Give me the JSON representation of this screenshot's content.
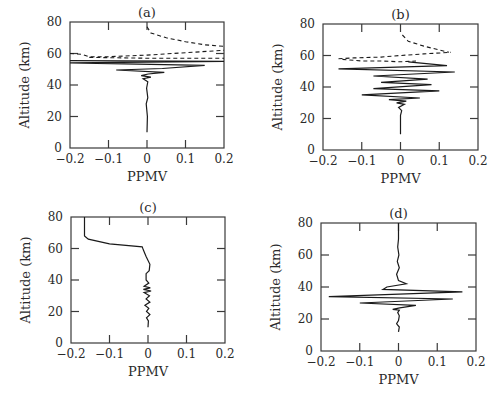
{
  "chart_data": [
    {
      "id": "a",
      "type": "line",
      "panel_label": "(a)",
      "xlabel": "PPMV",
      "ylabel": "Altitude (km)",
      "xlim": [
        -0.2,
        0.2
      ],
      "ylim": [
        0,
        80
      ],
      "xticks": [
        -0.2,
        -0.1,
        0,
        0.1,
        0.2
      ],
      "xtick_labels": [
        "−0.2",
        "−0.1",
        "0",
        "0.1",
        "0.2"
      ],
      "yticks": [
        0,
        20,
        40,
        60,
        80
      ],
      "ytick_labels": [
        "0",
        "20",
        "40",
        "60",
        "80"
      ],
      "frame": {
        "left": 70,
        "top": 22,
        "right": 224,
        "bottom": 148
      },
      "series": [
        {
          "name": "solid",
          "style": "solid",
          "points": [
            [
              0,
              10
            ],
            [
              0.001,
              20
            ],
            [
              -0.002,
              28
            ],
            [
              0.002,
              32
            ],
            [
              -0.001,
              38
            ],
            [
              0.002,
              42
            ],
            [
              -0.01,
              44
            ],
            [
              0.01,
              45
            ],
            [
              -0.015,
              46
            ],
            [
              0.003,
              47
            ],
            [
              0.045,
              48
            ],
            [
              -0.08,
              49.5
            ],
            [
              0.04,
              50.5
            ],
            [
              0.15,
              52.5
            ],
            [
              -0.2,
              54
            ],
            [
              0.2,
              55
            ],
            [
              -0.2,
              55.5
            ]
          ]
        },
        {
          "name": "dashed-upper",
          "style": "dashed",
          "points": [
            [
              0,
              77
            ],
            [
              0.01,
              73
            ],
            [
              0.05,
              70
            ],
            [
              0.1,
              67.5
            ],
            [
              0.15,
              65.5
            ],
            [
              0.2,
              64.5
            ]
          ]
        },
        {
          "name": "dashed-lower",
          "style": "dashed",
          "points": [
            [
              -0.2,
              60
            ],
            [
              -0.17,
              59.5
            ],
            [
              -0.15,
              58
            ],
            [
              -0.1,
              58
            ],
            [
              0,
              59
            ],
            [
              0.1,
              60.5
            ],
            [
              0.2,
              62
            ]
          ]
        },
        {
          "name": "dashed-inner",
          "style": "dashed",
          "points": [
            [
              -0.15,
              57.5
            ],
            [
              0,
              57
            ],
            [
              0.1,
              57
            ],
            [
              0.2,
              57
            ]
          ]
        }
      ]
    },
    {
      "id": "b",
      "type": "line",
      "panel_label": "(b)",
      "xlabel": "PPMV",
      "ylabel": "Altitude (km)",
      "xlim": [
        -0.2,
        0.2
      ],
      "ylim": [
        0,
        80
      ],
      "xticks": [
        -0.2,
        -0.1,
        0,
        0.1,
        0.2
      ],
      "xtick_labels": [
        "−0.2",
        "−0.1",
        "0",
        "0.1",
        "0.2"
      ],
      "yticks": [
        0,
        20,
        40,
        60,
        80
      ],
      "ytick_labels": [
        "0",
        "20",
        "40",
        "60",
        "80"
      ],
      "frame": {
        "left": 323,
        "top": 24,
        "right": 478,
        "bottom": 150
      },
      "series": [
        {
          "name": "solid",
          "style": "solid",
          "points": [
            [
              0,
              10
            ],
            [
              0,
              22
            ],
            [
              0.003,
              25
            ],
            [
              -0.005,
              27
            ],
            [
              0.01,
              29
            ],
            [
              -0.01,
              30
            ],
            [
              0.015,
              31
            ],
            [
              -0.03,
              32
            ],
            [
              0.05,
              33
            ],
            [
              -0.1,
              35
            ],
            [
              0.1,
              37.5
            ],
            [
              -0.07,
              39
            ],
            [
              0.08,
              41.5
            ],
            [
              -0.05,
              43
            ],
            [
              0.07,
              45
            ],
            [
              -0.07,
              47
            ],
            [
              0.14,
              49.5
            ],
            [
              -0.16,
              51.5
            ],
            [
              0.12,
              53.5
            ],
            [
              0.02,
              56
            ]
          ]
        },
        {
          "name": "dashed-upper",
          "style": "dashed",
          "points": [
            [
              0.005,
              73
            ],
            [
              0.02,
              69
            ],
            [
              0.06,
              66
            ],
            [
              0.1,
              63.5
            ],
            [
              0.125,
              62
            ]
          ]
        },
        {
          "name": "dashed-lower",
          "style": "dashed",
          "points": [
            [
              -0.16,
              58
            ],
            [
              -0.12,
              58.5
            ],
            [
              -0.05,
              59
            ],
            [
              0,
              60
            ],
            [
              0.06,
              61
            ],
            [
              0.13,
              62
            ]
          ]
        },
        {
          "name": "dashed-inner",
          "style": "dashed",
          "points": [
            [
              -0.15,
              57.5
            ],
            [
              -0.1,
              56.5
            ],
            [
              -0.05,
              56.5
            ],
            [
              0,
              56
            ],
            [
              0.04,
              56.5
            ]
          ]
        }
      ]
    },
    {
      "id": "c",
      "type": "line",
      "panel_label": "(c)",
      "xlabel": "PPMV",
      "ylabel": "Altitude (km)",
      "xlim": [
        -0.2,
        0.2
      ],
      "ylim": [
        0,
        80
      ],
      "xticks": [
        -0.2,
        -0.1,
        0,
        0.1,
        0.2
      ],
      "xtick_labels": [
        "−0.2",
        "−0.1",
        "0",
        "0.1",
        "0.2"
      ],
      "yticks": [
        0,
        20,
        40,
        60,
        80
      ],
      "ytick_labels": [
        "0",
        "20",
        "40",
        "60",
        "80"
      ],
      "frame": {
        "left": 71,
        "top": 217,
        "right": 225,
        "bottom": 343
      },
      "series": [
        {
          "name": "solid",
          "style": "solid",
          "points": [
            [
              0,
              10
            ],
            [
              0.001,
              14
            ],
            [
              -0.004,
              16
            ],
            [
              0.005,
              18
            ],
            [
              -0.004,
              20
            ],
            [
              0.002,
              22
            ],
            [
              -0.008,
              24
            ],
            [
              0.005,
              26
            ],
            [
              -0.005,
              28
            ],
            [
              0.004,
              30
            ],
            [
              -0.01,
              32
            ],
            [
              0.008,
              33
            ],
            [
              -0.012,
              34
            ],
            [
              0.006,
              35
            ],
            [
              -0.01,
              36
            ],
            [
              0.002,
              38
            ],
            [
              -0.005,
              40
            ],
            [
              -0.005,
              44
            ],
            [
              0.003,
              46
            ],
            [
              0.005,
              50
            ],
            [
              -0.005,
              55
            ],
            [
              -0.012,
              59
            ],
            [
              -0.015,
              61
            ],
            [
              -0.1,
              63
            ],
            [
              -0.155,
              66
            ],
            [
              -0.165,
              68
            ],
            [
              -0.165,
              73
            ],
            [
              -0.165,
              80
            ]
          ]
        }
      ]
    },
    {
      "id": "d",
      "type": "line",
      "panel_label": "(d)",
      "xlabel": "PPMV",
      "ylabel": "Altitude (km)",
      "xlim": [
        -0.2,
        0.2
      ],
      "ylim": [
        0,
        80
      ],
      "xticks": [
        -0.2,
        -0.1,
        0,
        0.1,
        0.2
      ],
      "xtick_labels": [
        "−0.2",
        "−0.1",
        "0",
        "0.1",
        "0.2"
      ],
      "yticks": [
        0,
        20,
        40,
        60,
        80
      ],
      "ytick_labels": [
        "0",
        "20",
        "40",
        "60",
        "80"
      ],
      "frame": {
        "left": 321,
        "top": 223,
        "right": 476,
        "bottom": 351
      },
      "series": [
        {
          "name": "solid",
          "style": "solid",
          "points": [
            [
              0,
              12
            ],
            [
              0.002,
              15
            ],
            [
              -0.005,
              17
            ],
            [
              0,
              19
            ],
            [
              0.002,
              22
            ],
            [
              -0.002,
              24
            ],
            [
              0.002,
              25.5
            ],
            [
              -0.015,
              26
            ],
            [
              0.003,
              27
            ],
            [
              0.045,
              28.5
            ],
            [
              -0.1,
              30
            ],
            [
              0.14,
              32.5
            ],
            [
              -0.18,
              34
            ],
            [
              0.165,
              37
            ],
            [
              -0.04,
              38.5
            ],
            [
              -0.03,
              40
            ],
            [
              0.02,
              42
            ],
            [
              0,
              44
            ],
            [
              -0.005,
              48
            ],
            [
              0.002,
              52
            ],
            [
              -0.003,
              56
            ],
            [
              0.001,
              60
            ],
            [
              -0.002,
              65
            ],
            [
              0,
              70
            ],
            [
              0,
              80
            ]
          ]
        }
      ]
    }
  ],
  "labels": {
    "xlabel": "PPMV",
    "ylabel": "Altitude (km)"
  },
  "colors": {
    "line": "#1a1a1a",
    "frame": "#3a3a3a",
    "text": "#2a2a2a",
    "background": "#ffffff"
  }
}
